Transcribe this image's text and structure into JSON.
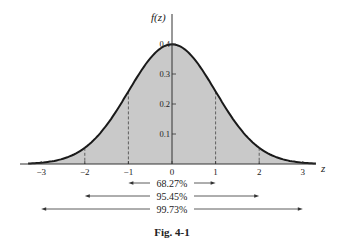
{
  "chart_data": {
    "type": "area",
    "title": "",
    "caption": "Fig. 4-1",
    "xlabel": "z",
    "ylabel": "f(z)",
    "xlim": [
      -3.3,
      3.3
    ],
    "ylim": [
      0,
      0.42
    ],
    "x_ticks": [
      -3,
      -2,
      -1,
      0,
      1,
      2,
      3
    ],
    "x_tick_labels": [
      "−3",
      "−2",
      "−1",
      "0",
      "1",
      "2",
      "3"
    ],
    "y_ticks": [
      0.1,
      0.2,
      0.3,
      0.4
    ],
    "y_tick_labels": [
      "0.1",
      "0.2",
      "0.3",
      "0.4"
    ],
    "series": [
      {
        "name": "standard normal density f(z)",
        "function": "exp(-z^2/2)/sqrt(2*pi)",
        "x": [
          -3,
          -2,
          -1,
          0,
          1,
          2,
          3
        ],
        "values": [
          0.0044,
          0.054,
          0.242,
          0.399,
          0.242,
          0.054,
          0.0044
        ]
      }
    ],
    "dashed_lines_at": [
      -2,
      -1,
      1,
      2
    ],
    "fill": "shaded area under curve",
    "grid": false,
    "annotations": [
      {
        "label": "68.27%",
        "from": -1,
        "to": 1
      },
      {
        "label": "95.45%",
        "from": -2,
        "to": 2
      },
      {
        "label": "99.73%",
        "from": -3,
        "to": 3
      }
    ]
  }
}
